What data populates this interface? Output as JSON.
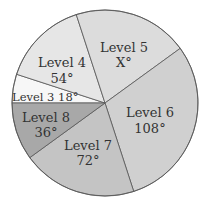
{
  "chart_data": {
    "type": "pie",
    "title": "",
    "unit": "degrees",
    "slices": [
      {
        "label": "Level 3",
        "value_text": "18°",
        "value": 18,
        "color": "#f7f7f7"
      },
      {
        "label": "Level 4",
        "value_text": "54°",
        "value": 54,
        "color": "#e6e6e6"
      },
      {
        "label": "Level 5",
        "value_text": "X°",
        "value": 72,
        "color": "#dcdcdc"
      },
      {
        "label": "Level 6",
        "value_text": "108°",
        "value": 108,
        "color": "#d0d0d0"
      },
      {
        "label": "Level 7",
        "value_text": "72°",
        "value": 72,
        "color": "#c4c4c4"
      },
      {
        "label": "Level 8",
        "value_text": "36°",
        "value": 36,
        "color": "#a8a8a8"
      }
    ]
  }
}
